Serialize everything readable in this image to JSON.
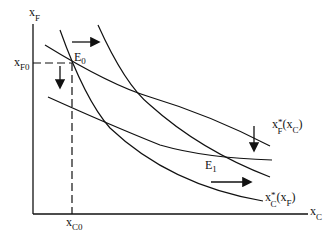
{
  "diagram": {
    "axes": {
      "y_label": "x",
      "y_sub": "F",
      "x_label": "x",
      "x_sub": "C"
    },
    "reference": {
      "y_tick": "x",
      "y_tick_sub": "F0",
      "x_tick": "x",
      "x_tick_sub": "C0"
    },
    "equilibria": [
      {
        "label": "E",
        "sub": "0"
      },
      {
        "label": "E",
        "sub": "1"
      }
    ],
    "curve_labels": {
      "f_reaction": {
        "main": "x",
        "star": "*",
        "sub": "F",
        "arg": "(x",
        "arg_sub": "C",
        "close": ")"
      },
      "c_reaction": {
        "main": "x",
        "star": "*",
        "sub": "C",
        "arg": "(x",
        "arg_sub": "F",
        "close": ")"
      }
    },
    "shifts": [
      "F reaction function shifts down",
      "C reaction function shifts right"
    ],
    "color": "#111111"
  }
}
